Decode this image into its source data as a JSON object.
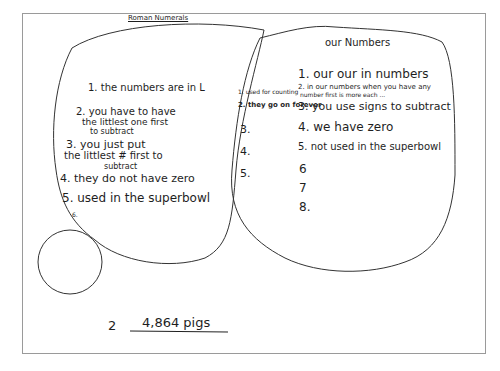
{
  "diagram": {
    "type": "venn",
    "left_set": {
      "title": "Roman Numerals",
      "items": [
        "1. the numbers are in L",
        "2. you have to have",
        "the littlest one first",
        "to subtract",
        "3. you just put",
        "the littlest # first to",
        "subtract",
        "4. they do not have zero",
        "5. used in the superbowl",
        "6."
      ]
    },
    "overlap": {
      "items": [
        "1. used for counting",
        "2. they go on forever",
        "3.",
        "4.",
        "5."
      ]
    },
    "right_set": {
      "title": "our Numbers",
      "items": [
        "1. our our in numbers",
        "2. in our numbers when you have any",
        "number first is more each ...",
        "3. you use signs to subtract",
        "4. we have zero",
        "5. not used in the superbowl",
        "6",
        "7",
        "8."
      ]
    },
    "extra_circle": {
      "label": ""
    },
    "answer": {
      "number": "2",
      "value": "4,864 pigs"
    }
  },
  "colors": {
    "ink": "#1e1e1e",
    "frame": "#9a9a9a",
    "background": "#ffffff"
  }
}
